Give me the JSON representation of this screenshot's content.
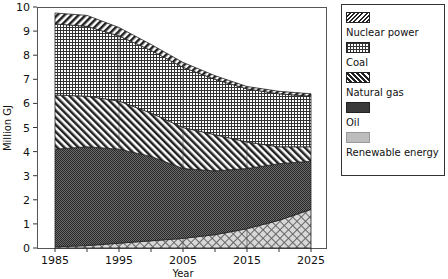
{
  "chart_data": {
    "type": "area",
    "stacked": true,
    "title": "",
    "xlabel": "Year",
    "ylabel": "Million GJ",
    "x": [
      1985,
      1990,
      1995,
      2000,
      2005,
      2010,
      2015,
      2020,
      2025
    ],
    "x_ticks": [
      1985,
      1995,
      2005,
      2015,
      2025
    ],
    "y_ticks": [
      0,
      1,
      2,
      3,
      4,
      5,
      6,
      7,
      8,
      9,
      10
    ],
    "ylim": [
      0,
      10
    ],
    "xlim": [
      1985,
      2025
    ],
    "grid": false,
    "legend_position": "right",
    "series": [
      {
        "name": "Renewable energy",
        "pattern": "crosshatch-light",
        "values": [
          0.05,
          0.1,
          0.2,
          0.3,
          0.4,
          0.55,
          0.8,
          1.15,
          1.6
        ]
      },
      {
        "name": "Oil",
        "pattern": "dense-dark",
        "values": [
          4.05,
          4.1,
          3.9,
          3.5,
          2.9,
          2.65,
          2.5,
          2.35,
          2.0
        ]
      },
      {
        "name": "Natural gas",
        "pattern": "diagonal-back",
        "values": [
          2.25,
          2.1,
          2.0,
          1.8,
          1.7,
          1.5,
          1.1,
          0.7,
          0.6
        ]
      },
      {
        "name": "Coal",
        "pattern": "grid",
        "values": [
          2.95,
          2.9,
          2.7,
          2.6,
          2.5,
          2.3,
          2.2,
          2.2,
          2.1
        ]
      },
      {
        "name": "Nuclear power",
        "pattern": "diagonal-fwd",
        "values": [
          0.45,
          0.45,
          0.35,
          0.25,
          0.2,
          0.15,
          0.1,
          0.1,
          0.1
        ]
      }
    ]
  },
  "legend": {
    "items": [
      {
        "label": "Nuclear power"
      },
      {
        "label": "Coal"
      },
      {
        "label": "Natural gas"
      },
      {
        "label": "Oil"
      },
      {
        "label": "Renewable energy"
      }
    ]
  },
  "axes": {
    "ylabel": "Million GJ",
    "xlabel": "Year"
  }
}
